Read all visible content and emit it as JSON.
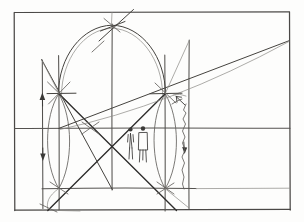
{
  "document": {
    "type": "hand-drawn architectural geometry sketch",
    "title": "Arch and Square Proportional Study",
    "medium": "pencil line drawing on white paper",
    "canvas": {
      "width": 304,
      "height": 222
    },
    "background_color": "#fdfdfc",
    "ink_color": "#3b3a38"
  },
  "geometry": {
    "outer_frame": {
      "name": "page-border-rectangle",
      "x": 14,
      "y": 12,
      "width": 276,
      "height": 198
    },
    "horizontal_rules": [
      {
        "name": "upper-rule",
        "y": 12,
        "x1": 14,
        "x2": 290
      },
      {
        "name": "mid-rule",
        "y": 128,
        "x1": 14,
        "x2": 290
      },
      {
        "name": "lower-rule",
        "y": 188,
        "x1": 14,
        "x2": 290
      },
      {
        "name": "baseline-rule",
        "y": 210,
        "x1": 14,
        "x2": 290
      }
    ],
    "vertical_rules": [
      {
        "name": "left-edge",
        "x": 14,
        "y1": 12,
        "y2": 210
      },
      {
        "name": "left-column",
        "x": 42,
        "y1": 60,
        "y2": 208
      },
      {
        "name": "left-pier",
        "x": 59,
        "y1": 55,
        "y2": 210
      },
      {
        "name": "center-axis",
        "x": 112,
        "y1": 24,
        "y2": 190
      },
      {
        "name": "right-pier",
        "x": 165,
        "y1": 55,
        "y2": 210
      },
      {
        "name": "right-column",
        "x": 189,
        "y1": 40,
        "y2": 208
      },
      {
        "name": "right-edge",
        "x": 290,
        "y1": 12,
        "y2": 210
      }
    ],
    "arch": {
      "name": "semicircular-arch",
      "spring_left": {
        "x": 59,
        "y": 93
      },
      "apex": {
        "x": 112,
        "y": 25
      },
      "spring_right": {
        "x": 165,
        "y": 93
      },
      "radius": 53
    },
    "vesica_arcs": [
      {
        "name": "left-lens-arc-outer",
        "from": {
          "x": 59,
          "y": 93
        },
        "to": {
          "x": 59,
          "y": 188
        }
      },
      {
        "name": "left-lens-arc-inner",
        "from": {
          "x": 59,
          "y": 93
        },
        "to": {
          "x": 59,
          "y": 188
        }
      },
      {
        "name": "right-lens-arc-outer",
        "from": {
          "x": 165,
          "y": 93
        },
        "to": {
          "x": 165,
          "y": 188
        }
      },
      {
        "name": "right-lens-arc-inner",
        "from": {
          "x": 165,
          "y": 93
        },
        "to": {
          "x": 165,
          "y": 188
        }
      }
    ],
    "diagonals": [
      {
        "name": "diagonal-upper-left-to-lower-right",
        "from": {
          "x": 59,
          "y": 93
        },
        "to": {
          "x": 165,
          "y": 188
        }
      },
      {
        "name": "diagonal-lower-left-to-upper-right",
        "from": {
          "x": 48,
          "y": 210
        },
        "to": {
          "x": 165,
          "y": 93
        }
      },
      {
        "name": "diagonal-crossing-left",
        "from": {
          "x": 42,
          "y": 60
        },
        "to": {
          "x": 112,
          "y": 188
        }
      },
      {
        "name": "diagonal-rising-to-right-edge",
        "from": {
          "x": 59,
          "y": 128
        },
        "to": {
          "x": 290,
          "y": 40
        }
      },
      {
        "name": "apex-ray-upper-right",
        "from": {
          "x": 100,
          "y": 40
        },
        "to": {
          "x": 132,
          "y": 10
        }
      }
    ],
    "nodes": [
      {
        "name": "node-apex",
        "x": 112,
        "y": 25
      },
      {
        "name": "node-spring-left",
        "x": 59,
        "y": 93
      },
      {
        "name": "node-spring-right",
        "x": 165,
        "y": 93
      },
      {
        "name": "node-center-cross",
        "x": 90,
        "y": 128
      },
      {
        "name": "node-base-left",
        "x": 59,
        "y": 188
      },
      {
        "name": "node-base-right",
        "x": 165,
        "y": 188
      },
      {
        "name": "node-foot-left",
        "x": 48,
        "y": 210
      },
      {
        "name": "node-foot-right",
        "x": 176,
        "y": 210
      }
    ]
  },
  "annotations": {
    "scale_figures": [
      {
        "name": "scale-figure-left",
        "x": 130,
        "y": 128,
        "height": 32
      },
      {
        "name": "scale-figure-right",
        "x": 142,
        "y": 128,
        "height": 34
      }
    ],
    "dimension_arrows": [
      {
        "name": "dimension-arrow-left-upper",
        "x": 42,
        "y": 98,
        "direction": "up"
      },
      {
        "name": "dimension-arrow-left-lower",
        "x": 42,
        "y": 155,
        "direction": "down"
      },
      {
        "name": "dimension-arrow-right-upper",
        "x": 178,
        "y": 100,
        "direction": "up-left"
      },
      {
        "name": "dimension-arrow-right-lower",
        "x": 185,
        "y": 148,
        "direction": "down"
      }
    ],
    "freehand_marks": [
      {
        "name": "wobble-line-right-pier",
        "x": 183,
        "y": 118
      }
    ]
  }
}
